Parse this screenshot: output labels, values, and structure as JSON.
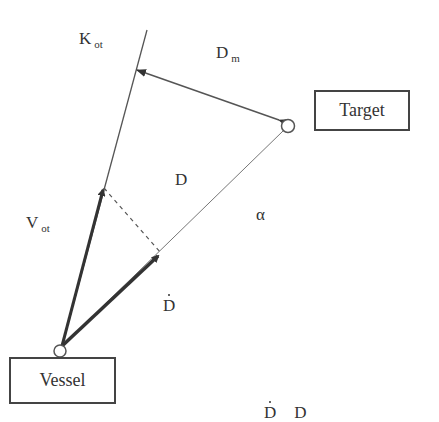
{
  "diagram": {
    "nodes": {
      "vessel": {
        "label": "Vessel"
      },
      "target": {
        "label": "Target"
      }
    },
    "labels": {
      "k_ot": {
        "main": "K",
        "sub": "ot"
      },
      "d_m": {
        "main": "D",
        "sub": "m"
      },
      "d": "D",
      "alpha": "α",
      "v_ot": {
        "main": "V",
        "sub": "ot"
      },
      "d_dot": "D",
      "caption_partial": {
        "left": "D",
        "right": "D"
      }
    },
    "edges": [
      {
        "name": "course-line-k-ot",
        "style": "thin",
        "from": "vessel",
        "to": "top"
      },
      {
        "name": "line-of-sight-d",
        "style": "thin",
        "from": "vessel",
        "to": "target"
      },
      {
        "name": "velocity-vector-v-ot",
        "style": "thick-arrow"
      },
      {
        "name": "range-rate-vector-d-dot",
        "style": "thick-arrow"
      },
      {
        "name": "projection-dashed",
        "style": "dashed"
      },
      {
        "name": "miss-distance-d-m",
        "style": "double-arrow"
      }
    ],
    "colors": {
      "line": "#555555",
      "text": "#333333",
      "background": "#ffffff"
    }
  }
}
